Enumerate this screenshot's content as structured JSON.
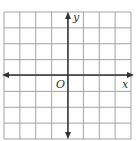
{
  "diagram": {
    "type": "coordinate-plane",
    "grid": {
      "columns": 8,
      "rows": 8,
      "left": 4,
      "top": 12,
      "right": 131,
      "bottom": 139,
      "line_color": "#a3a3a3"
    },
    "axes": {
      "color": "#333333",
      "x_axis_y": 75,
      "y_axis_x": 68,
      "x_label": "x",
      "y_label": "y",
      "origin_label": "O"
    }
  }
}
